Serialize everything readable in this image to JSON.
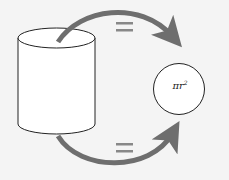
{
  "diagram": {
    "shapes": {
      "left": "cylinder",
      "right": "circle"
    },
    "circle_label": {
      "base": "πr",
      "exponent": "2"
    },
    "arrows": [
      {
        "from": "cylinder-top",
        "to": "circle",
        "label": "="
      },
      {
        "from": "cylinder-bottom",
        "to": "circle",
        "label": "="
      }
    ],
    "colors": {
      "arrow": "#6e6e6e",
      "stroke": "#222222",
      "background": "#f4f4f4"
    }
  }
}
